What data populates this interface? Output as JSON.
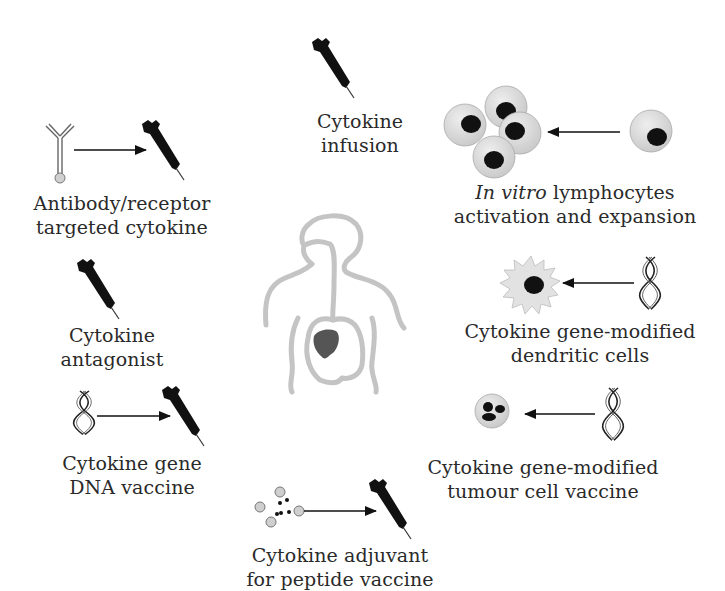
{
  "diagram": {
    "type": "cytokine-based immunotherapy strategies",
    "center": {
      "icon": "human-torso-with-tumour-icon"
    },
    "strategies": [
      {
        "id": "cytokine-infusion",
        "line1": "Cytokine",
        "line2": "infusion",
        "icons": [
          "syringe-icon"
        ]
      },
      {
        "id": "antibody-receptor-targeted-cytokine",
        "line1": "Antibody/receptor",
        "line2": "targeted cytokine",
        "icons": [
          "antibody-icon",
          "arrow-right-icon",
          "syringe-icon"
        ]
      },
      {
        "id": "cytokine-antagonist",
        "line1": "Cytokine",
        "line2": "antagonist",
        "icons": [
          "syringe-icon"
        ]
      },
      {
        "id": "cytokine-gene-dna-vaccine",
        "line1": "Cytokine gene",
        "line2": "DNA vaccine",
        "icons": [
          "dna-icon",
          "arrow-right-icon",
          "syringe-icon"
        ]
      },
      {
        "id": "cytokine-adjuvant-peptide-vaccine",
        "line1": "Cytokine adjuvant",
        "line2": "for peptide vaccine",
        "icons": [
          "peptide-icon",
          "arrow-right-icon",
          "syringe-icon"
        ]
      },
      {
        "id": "in-vitro-lymphocytes",
        "line1_italic": "In vitro",
        "line1_rest": " lymphocytes",
        "line2": "activation and expansion",
        "icons": [
          "lymphocyte-cluster-icon",
          "arrow-left-icon",
          "lymphocyte-icon"
        ]
      },
      {
        "id": "gene-modified-dendritic-cells",
        "line1": "Cytokine gene-modified",
        "line2": "dendritic cells",
        "icons": [
          "dendritic-cell-icon",
          "arrow-left-icon",
          "dna-icon"
        ]
      },
      {
        "id": "gene-modified-tumour-cell-vaccine",
        "line1": "Cytokine gene-modified",
        "line2": "tumour cell vaccine",
        "icons": [
          "tumour-cell-icon",
          "arrow-left-icon",
          "dna-icon"
        ]
      }
    ],
    "colors": {
      "ink": "#111111",
      "text": "#2a2a2a",
      "cell_fill": "#d9d9d9",
      "body_outline": "#bdbdbd",
      "tumour": "#555555"
    }
  }
}
